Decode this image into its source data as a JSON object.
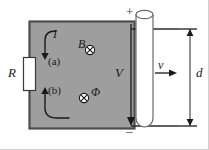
{
  "figure": {
    "colors": {
      "loop_fill": "#9e9e9e",
      "loop_border": "#4d4d4d",
      "rod_fill": "#ffffff",
      "rod_border": "#6b6b6b",
      "line": "#1a1a1a",
      "background": "#ffffff",
      "frame": "#cfcfcf"
    },
    "labels": {
      "resistor": "R",
      "current": "I",
      "point_a": "(a)",
      "point_b": "(b)",
      "field": "B",
      "flux": "Φ",
      "voltage": "V",
      "velocity": "v",
      "separation": "d",
      "terminal_positive": "+",
      "terminal_negative": "–"
    },
    "symbols": {
      "field_marker": "circle-x-into-page",
      "flux_marker": "circle-x-into-page",
      "current_arrow_a": "arrow-down",
      "current_arrow_b": "arrow-up",
      "voltage_arrow": "arrow-down",
      "velocity_arrow": "arrow-right",
      "dimension_arrows": "double-headed-vertical"
    }
  }
}
